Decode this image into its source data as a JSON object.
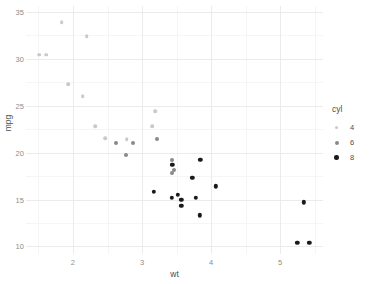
{
  "chart_data": {
    "type": "scatter",
    "title": "",
    "xlabel": "wt",
    "ylabel": "mpg",
    "xlim": [
      1.32,
      5.62
    ],
    "ylim": [
      9.2,
      35.6
    ],
    "xticks": [
      2,
      3,
      4,
      5
    ],
    "yticks": [
      10,
      15,
      20,
      25,
      30,
      35
    ],
    "xminor": [
      1.5,
      2.5,
      3.5,
      4.5,
      5.5
    ],
    "yminor": [
      12.5,
      17.5,
      22.5,
      27.5,
      32.5
    ],
    "grid": true,
    "legend": {
      "title": "cyl",
      "position": "right",
      "entries": [
        {
          "label": "4",
          "color": "#c9c9c9"
        },
        {
          "label": "6",
          "color": "#8a8a8a"
        },
        {
          "label": "8",
          "color": "#1a1a1a"
        }
      ]
    },
    "series": [
      {
        "name": "4",
        "cyl": 4,
        "color": "#c9c9c9",
        "points": [
          {
            "x": 2.32,
            "y": 22.8
          },
          {
            "x": 3.19,
            "y": 24.4
          },
          {
            "x": 3.15,
            "y": 22.8
          },
          {
            "x": 2.2,
            "y": 32.4
          },
          {
            "x": 1.615,
            "y": 30.4
          },
          {
            "x": 1.835,
            "y": 33.9
          },
          {
            "x": 2.465,
            "y": 21.5
          },
          {
            "x": 1.935,
            "y": 27.3
          },
          {
            "x": 2.14,
            "y": 26.0
          },
          {
            "x": 1.513,
            "y": 30.4
          },
          {
            "x": 2.78,
            "y": 21.4
          }
        ]
      },
      {
        "name": "6",
        "cyl": 6,
        "color": "#8a8a8a",
        "points": [
          {
            "x": 2.62,
            "y": 21.0
          },
          {
            "x": 2.875,
            "y": 21.0
          },
          {
            "x": 3.215,
            "y": 21.4
          },
          {
            "x": 3.46,
            "y": 18.1
          },
          {
            "x": 3.44,
            "y": 19.2
          },
          {
            "x": 3.44,
            "y": 17.8
          },
          {
            "x": 2.77,
            "y": 19.7
          }
        ]
      },
      {
        "name": "8",
        "cyl": 8,
        "color": "#1a1a1a",
        "points": [
          {
            "x": 3.44,
            "y": 18.7
          },
          {
            "x": 4.07,
            "y": 16.4
          },
          {
            "x": 3.73,
            "y": 17.3
          },
          {
            "x": 3.78,
            "y": 15.2
          },
          {
            "x": 5.25,
            "y": 10.4
          },
          {
            "x": 5.424,
            "y": 10.4
          },
          {
            "x": 5.345,
            "y": 14.7
          },
          {
            "x": 3.52,
            "y": 15.5
          },
          {
            "x": 3.435,
            "y": 15.2
          },
          {
            "x": 3.84,
            "y": 13.3
          },
          {
            "x": 3.845,
            "y": 19.2
          },
          {
            "x": 3.17,
            "y": 15.8
          },
          {
            "x": 3.57,
            "y": 15.0
          },
          {
            "x": 3.57,
            "y": 14.3
          }
        ]
      }
    ]
  }
}
